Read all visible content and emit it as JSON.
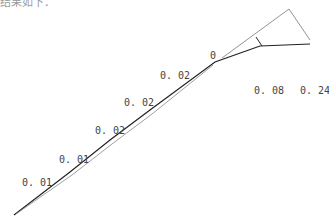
{
  "top_text": "结果如下：",
  "labels": [
    {
      "text": "0.01",
      "x": 22,
      "y": 186
    },
    {
      "text": "0.01",
      "x": 59,
      "y": 163
    },
    {
      "text": "0.02",
      "x": 95,
      "y": 134
    },
    {
      "text": "0.02",
      "x": 124,
      "y": 106
    },
    {
      "text": "0.02",
      "x": 160,
      "y": 79
    },
    {
      "text": "0",
      "x": 210,
      "y": 59
    },
    {
      "text": "0.08",
      "x": 254,
      "y": 94
    },
    {
      "text": "0.24",
      "x": 300,
      "y": 94
    }
  ]
}
